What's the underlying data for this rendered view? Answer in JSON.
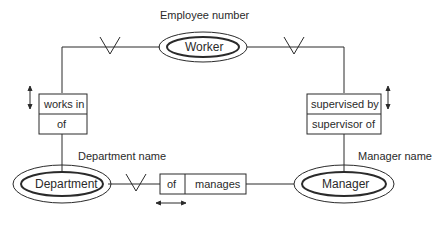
{
  "diagram": {
    "type": "entity-relationship",
    "entities": [
      {
        "id": "worker",
        "label": "Worker",
        "attribute": "Employee number"
      },
      {
        "id": "department",
        "label": "Department",
        "attribute": "Department name"
      },
      {
        "id": "manager",
        "label": "Manager",
        "attribute": "Manager name"
      }
    ],
    "relationships": [
      {
        "id": "works-in",
        "from": "worker",
        "to": "department",
        "forward": "works in",
        "reverse": "of",
        "crows_foot_at": "worker"
      },
      {
        "id": "supervised-by",
        "from": "worker",
        "to": "manager",
        "forward": "supervised by",
        "reverse": "supervisor of",
        "crows_foot_at": "worker"
      },
      {
        "id": "manages",
        "from": "department",
        "to": "manager",
        "forward": "of",
        "reverse": "manages",
        "crows_foot_at": "department"
      }
    ],
    "colors": {
      "line": "#2a2a2a",
      "background": "#ffffff"
    }
  }
}
